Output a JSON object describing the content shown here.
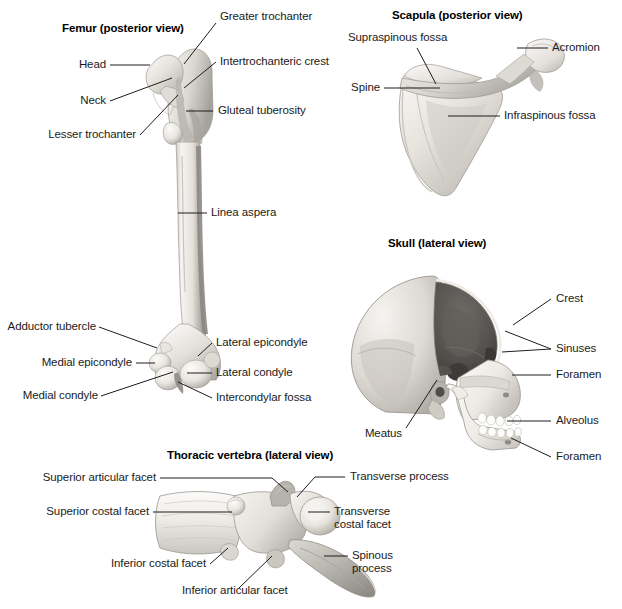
{
  "figures": [
    {
      "id": "femur",
      "title": "Femur (posterior view)",
      "labels": [
        "Greater trochanter",
        "Head",
        "Intertrochanteric crest",
        "Neck",
        "Gluteal tuberosity",
        "Lesser trochanter",
        "Linea aspera",
        "Adductor tubercle",
        "Lateral epicondyle",
        "Medial epicondyle",
        "Lateral condyle",
        "Medial condyle",
        "Intercondylar fossa"
      ]
    },
    {
      "id": "scapula",
      "title": "Scapula (posterior view)",
      "labels": [
        "Supraspinous fossa",
        "Acromion",
        "Spine",
        "Infraspinous fossa"
      ]
    },
    {
      "id": "skull",
      "title": "Skull (lateral view)",
      "labels": [
        "Crest",
        "Sinuses",
        "Foramen",
        "Alveolus",
        "Foramen",
        "Meatus"
      ]
    },
    {
      "id": "vertebra",
      "title": "Thoracic vertebra (lateral view)",
      "labels": [
        "Superior articular facet",
        "Transverse process",
        "Superior costal facet",
        "Transverse",
        "costal facet",
        "Inferior costal facet",
        "Spinous",
        "process",
        "Inferior articular facet"
      ]
    }
  ],
  "femur": {
    "title": "Femur (posterior view)",
    "greater_trochanter": "Greater trochanter",
    "head": "Head",
    "intertrochanteric_crest": "Intertrochanteric crest",
    "neck": "Neck",
    "gluteal_tuberosity": "Gluteal tuberosity",
    "lesser_trochanter": "Lesser trochanter",
    "linea_aspera": "Linea aspera",
    "adductor_tubercle": "Adductor tubercle",
    "lateral_epicondyle": "Lateral epicondyle",
    "medial_epicondyle": "Medial epicondyle",
    "lateral_condyle": "Lateral condyle",
    "medial_condyle": "Medial condyle",
    "intercondylar_fossa": "Intercondylar fossa"
  },
  "scapula": {
    "title": "Scapula (posterior view)",
    "supraspinous_fossa": "Supraspinous fossa",
    "acromion": "Acromion",
    "spine": "Spine",
    "infraspinous_fossa": "Infraspinous fossa"
  },
  "skull": {
    "title": "Skull (lateral view)",
    "crest": "Crest",
    "sinuses": "Sinuses",
    "foramen_upper": "Foramen",
    "alveolus": "Alveolus",
    "foramen_lower": "Foramen",
    "meatus": "Meatus"
  },
  "vertebra": {
    "title": "Thoracic vertebra (lateral view)",
    "superior_articular_facet": "Superior articular facet",
    "transverse_process": "Transverse process",
    "superior_costal_facet": "Superior costal facet",
    "transverse_costal_facet_l1": "Transverse",
    "transverse_costal_facet_l2": "costal facet",
    "inferior_costal_facet": "Inferior costal facet",
    "spinous_process_l1": "Spinous",
    "spinous_process_l2": "process",
    "inferior_articular_facet": "Inferior articular facet"
  },
  "colors": {
    "background": "#ffffff",
    "text": "#1b1b1b",
    "leader_line": "#1d1d1d",
    "bone_light": "#f2f0ec",
    "bone_mid": "#d8d5cf",
    "bone_shadow": "#a9a5a0",
    "bone_dark": "#7d7a75",
    "cavity_dark": "#4a4744"
  }
}
